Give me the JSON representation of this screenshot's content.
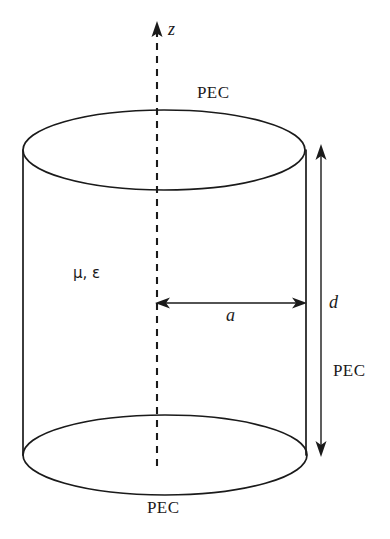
{
  "figure": {
    "background_color": "#ffffff",
    "line_color": "#1a1a1a",
    "text_color": "#1a1a1a",
    "width": 390,
    "height": 539
  },
  "labels": {
    "axis_z": "z",
    "pec_top": "PEC",
    "pec_bottom": "PEC",
    "pec_side": "PEC",
    "material": "μ, ε",
    "radius": "a",
    "height": "d"
  },
  "geometry": {
    "cylinder": {
      "center_x": 164,
      "top_ellipse_cy": 150,
      "bottom_ellipse_cy": 455,
      "ellipse_rx": 141,
      "ellipse_ry": 40,
      "wall_left_x": 23,
      "wall_right_x": 306
    },
    "axis": {
      "x": 157,
      "arrow_tip_y": 22,
      "bottom_y": 466,
      "style": "dashed"
    },
    "radius_dimension": {
      "y": 303,
      "x_start": 157,
      "x_end": 305,
      "double_headed": true
    },
    "height_dimension": {
      "x": 321,
      "y_top": 145,
      "y_bottom": 456,
      "double_headed": true
    }
  }
}
